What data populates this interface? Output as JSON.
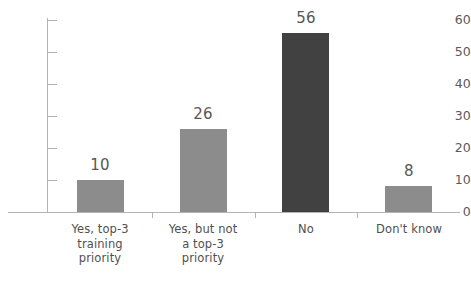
{
  "chart_data": {
    "type": "bar",
    "title": "",
    "subtitle": "",
    "xlabel": "",
    "ylabel": "",
    "categories": [
      "Yes, top-3 training priority",
      "Yes, but not a top-3 priority",
      "No",
      "Don't know"
    ],
    "category_lines": [
      [
        "Yes, top-3",
        "training",
        "priority"
      ],
      [
        "Yes, but not",
        "a top-3",
        "priority"
      ],
      [
        "No"
      ],
      [
        "Don't know"
      ]
    ],
    "values": [
      10,
      26,
      56,
      8
    ],
    "value_labels": [
      "10",
      "26",
      "56",
      "8"
    ],
    "ylim": [
      0,
      60
    ],
    "yticks": [
      0,
      10,
      20,
      30,
      40,
      50,
      60
    ],
    "ytick_labels": [
      "0",
      "10",
      "20",
      "30",
      "40",
      "50",
      "60"
    ],
    "grid": false,
    "legend": null,
    "bar_colors": [
      "#8c8c8c",
      "#8c8c8c",
      "#414141",
      "#8c8c8c"
    ],
    "highlight_index": 2,
    "colors": {
      "bar_light": "#8c8c8c",
      "bar_dark": "#414141",
      "axis": "#b4b4b4",
      "tick_text": "#5a5a5a",
      "value_text": "#575757",
      "category_text": "#4f4f4f",
      "background": "#ffffff"
    }
  }
}
